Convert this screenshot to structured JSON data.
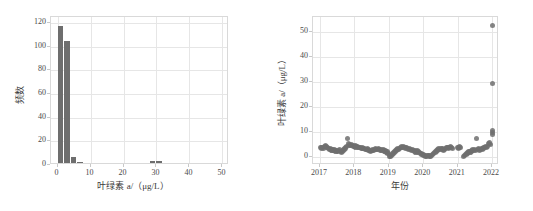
{
  "figure": {
    "background": "#ffffff",
    "marker_color": "#6e6e6e",
    "grid_color": "#e6e6e6",
    "frame_color": "#d9d9d9"
  },
  "chart_data": [
    {
      "type": "bar",
      "panel": "left",
      "title": "",
      "xlabel": "叶绿素 a/（μg/L）",
      "ylabel": "频数",
      "xlim": [
        -2,
        52
      ],
      "ylim": [
        0,
        125
      ],
      "xticks": [
        "0",
        "10",
        "20",
        "30",
        "40",
        "50"
      ],
      "xtick_values": [
        0,
        10,
        20,
        30,
        40,
        50
      ],
      "yticks": [
        "0",
        "20",
        "40",
        "60",
        "80",
        "100",
        "120"
      ],
      "ytick_values": [
        0,
        20,
        40,
        60,
        80,
        100,
        120
      ],
      "grid": true,
      "legend": "none",
      "bin_width": 2,
      "categories": [
        1,
        3,
        5,
        7,
        9,
        11,
        13,
        15,
        17,
        19,
        21,
        23,
        25,
        27,
        29,
        31,
        33
      ],
      "values": [
        116,
        103,
        5,
        1,
        0,
        0,
        0,
        0,
        0,
        0,
        0,
        0,
        0,
        0,
        2,
        2,
        0
      ]
    },
    {
      "type": "scatter",
      "panel": "right",
      "title": "",
      "xlabel": "年份",
      "ylabel": "叶绿素 a/（μg/L）",
      "xlim": [
        2016.8,
        2022.2
      ],
      "ylim": [
        -3,
        56
      ],
      "xticks": [
        "2017",
        "2018",
        "2019",
        "2020",
        "2021",
        "2022"
      ],
      "xtick_values": [
        2017,
        2018,
        2019,
        2020,
        2021,
        2022
      ],
      "yticks": [
        "0",
        "10",
        "20",
        "30",
        "40",
        "50"
      ],
      "ytick_values": [
        0,
        10,
        20,
        30,
        40,
        50
      ],
      "grid": true,
      "legend": "none",
      "series": [
        {
          "name": "叶绿素 a",
          "points": [
            [
              2017.02,
              4.0
            ],
            [
              2017.05,
              3.8
            ],
            [
              2017.08,
              4.1
            ],
            [
              2017.11,
              3.6
            ],
            [
              2017.14,
              4.3
            ],
            [
              2017.17,
              4.6
            ],
            [
              2017.2,
              4.2
            ],
            [
              2017.23,
              3.9
            ],
            [
              2017.26,
              3.5
            ],
            [
              2017.29,
              3.2
            ],
            [
              2017.32,
              3.4
            ],
            [
              2017.35,
              3.0
            ],
            [
              2017.38,
              2.8
            ],
            [
              2017.41,
              3.1
            ],
            [
              2017.44,
              2.9
            ],
            [
              2017.47,
              2.6
            ],
            [
              2017.5,
              2.4
            ],
            [
              2017.53,
              2.7
            ],
            [
              2017.56,
              3.0
            ],
            [
              2017.59,
              2.5
            ],
            [
              2017.62,
              2.2
            ],
            [
              2017.65,
              2.6
            ],
            [
              2017.68,
              3.0
            ],
            [
              2017.71,
              3.4
            ],
            [
              2017.74,
              3.8
            ],
            [
              2017.77,
              4.4
            ],
            [
              2017.8,
              7.6
            ],
            [
              2017.83,
              5.4
            ],
            [
              2017.86,
              5.0
            ],
            [
              2017.89,
              4.7
            ],
            [
              2017.92,
              5.2
            ],
            [
              2017.95,
              4.9
            ],
            [
              2017.98,
              4.5
            ],
            [
              2018.02,
              4.6
            ],
            [
              2018.05,
              4.2
            ],
            [
              2018.08,
              4.4
            ],
            [
              2018.11,
              4.0
            ],
            [
              2018.14,
              3.9
            ],
            [
              2018.17,
              4.1
            ],
            [
              2018.2,
              3.7
            ],
            [
              2018.23,
              3.8
            ],
            [
              2018.26,
              3.5
            ],
            [
              2018.29,
              3.6
            ],
            [
              2018.32,
              3.3
            ],
            [
              2018.35,
              3.1
            ],
            [
              2018.38,
              3.4
            ],
            [
              2018.41,
              3.0
            ],
            [
              2018.44,
              2.8
            ],
            [
              2018.47,
              2.5
            ],
            [
              2018.5,
              2.7
            ],
            [
              2018.53,
              3.0
            ],
            [
              2018.56,
              2.9
            ],
            [
              2018.59,
              3.2
            ],
            [
              2018.62,
              3.4
            ],
            [
              2018.65,
              3.1
            ],
            [
              2018.68,
              3.3
            ],
            [
              2018.71,
              3.6
            ],
            [
              2018.74,
              3.2
            ],
            [
              2018.77,
              3.0
            ],
            [
              2018.8,
              2.8
            ],
            [
              2018.83,
              3.1
            ],
            [
              2018.86,
              2.9
            ],
            [
              2018.89,
              2.6
            ],
            [
              2018.92,
              2.4
            ],
            [
              2018.95,
              2.2
            ],
            [
              2018.98,
              1.6
            ],
            [
              2019.01,
              0.6
            ],
            [
              2019.04,
              0.4
            ],
            [
              2019.07,
              0.9
            ],
            [
              2019.1,
              1.4
            ],
            [
              2019.13,
              1.8
            ],
            [
              2019.16,
              2.2
            ],
            [
              2019.19,
              2.6
            ],
            [
              2019.22,
              3.0
            ],
            [
              2019.25,
              3.4
            ],
            [
              2019.28,
              3.2
            ],
            [
              2019.31,
              3.6
            ],
            [
              2019.34,
              3.9
            ],
            [
              2019.37,
              4.2
            ],
            [
              2019.4,
              4.0
            ],
            [
              2019.43,
              4.4
            ],
            [
              2019.46,
              4.1
            ],
            [
              2019.49,
              3.8
            ],
            [
              2019.52,
              4.0
            ],
            [
              2019.55,
              3.6
            ],
            [
              2019.58,
              3.3
            ],
            [
              2019.61,
              3.5
            ],
            [
              2019.64,
              3.1
            ],
            [
              2019.67,
              2.9
            ],
            [
              2019.7,
              3.2
            ],
            [
              2019.73,
              2.8
            ],
            [
              2019.76,
              2.5
            ],
            [
              2019.79,
              2.2
            ],
            [
              2019.82,
              2.6
            ],
            [
              2019.85,
              2.3
            ],
            [
              2019.88,
              2.0
            ],
            [
              2019.91,
              1.7
            ],
            [
              2019.94,
              1.4
            ],
            [
              2019.97,
              1.2
            ],
            [
              2020.01,
              1.0
            ],
            [
              2020.04,
              0.8
            ],
            [
              2020.07,
              0.6
            ],
            [
              2020.1,
              0.5
            ],
            [
              2020.13,
              0.7
            ],
            [
              2020.16,
              0.9
            ],
            [
              2020.19,
              0.6
            ],
            [
              2020.22,
              0.4
            ],
            [
              2020.25,
              0.8
            ],
            [
              2020.28,
              1.1
            ],
            [
              2020.31,
              1.5
            ],
            [
              2020.34,
              1.9
            ],
            [
              2020.37,
              2.3
            ],
            [
              2020.4,
              2.7
            ],
            [
              2020.43,
              3.1
            ],
            [
              2020.46,
              3.5
            ],
            [
              2020.49,
              3.3
            ],
            [
              2020.52,
              3.7
            ],
            [
              2020.55,
              3.4
            ],
            [
              2020.58,
              3.0
            ],
            [
              2020.61,
              3.2
            ],
            [
              2020.64,
              3.6
            ],
            [
              2020.67,
              3.9
            ],
            [
              2020.7,
              4.1
            ],
            [
              2020.73,
              3.8
            ],
            [
              2020.76,
              4.0
            ],
            [
              2020.79,
              4.3
            ],
            [
              2020.82,
              4.0
            ],
            [
              2020.85,
              3.7
            ],
            [
              2021.0,
              4.0
            ],
            [
              2021.03,
              3.8
            ],
            [
              2021.06,
              4.2
            ],
            [
              2021.09,
              3.9
            ],
            [
              2021.18,
              0.5
            ],
            [
              2021.21,
              0.9
            ],
            [
              2021.24,
              1.3
            ],
            [
              2021.27,
              1.7
            ],
            [
              2021.3,
              2.1
            ],
            [
              2021.33,
              2.5
            ],
            [
              2021.36,
              2.2
            ],
            [
              2021.39,
              2.6
            ],
            [
              2021.42,
              3.0
            ],
            [
              2021.45,
              2.7
            ],
            [
              2021.48,
              3.1
            ],
            [
              2021.51,
              2.8
            ],
            [
              2021.54,
              7.7
            ],
            [
              2021.57,
              3.2
            ],
            [
              2021.6,
              3.5
            ],
            [
              2021.63,
              3.0
            ],
            [
              2021.66,
              3.3
            ],
            [
              2021.69,
              3.7
            ],
            [
              2021.72,
              3.4
            ],
            [
              2021.75,
              3.8
            ],
            [
              2021.78,
              4.1
            ],
            [
              2021.81,
              4.4
            ],
            [
              2021.84,
              4.0
            ],
            [
              2021.87,
              4.3
            ],
            [
              2021.9,
              5.5
            ],
            [
              2021.93,
              5.8
            ],
            [
              2021.96,
              5.2
            ],
            [
              2022.0,
              9.0
            ],
            [
              2022.0,
              10.6
            ],
            [
              2022.0,
              10.0
            ],
            [
              2022.0,
              29.5
            ],
            [
              2022.0,
              52.5
            ]
          ]
        }
      ]
    }
  ]
}
